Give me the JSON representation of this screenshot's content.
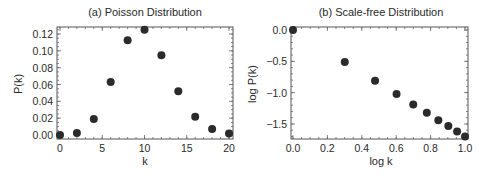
{
  "chart_data": [
    {
      "type": "scatter",
      "title": "(a) Poisson Distribution",
      "xlabel": "k",
      "ylabel": "P(k)",
      "xlim": [
        0,
        20
      ],
      "ylim": [
        0,
        0.128
      ],
      "x_ticks": [
        "0",
        "5",
        "10",
        "15",
        "20"
      ],
      "y_ticks": [
        "0.00",
        "0.02",
        "0.04",
        "0.06",
        "0.08",
        "0.10",
        "0.12"
      ],
      "grid": false,
      "x": [
        0,
        2,
        4,
        6,
        8,
        10,
        12,
        14,
        16,
        18,
        20
      ],
      "values": [
        0.0,
        0.0023,
        0.0189,
        0.0631,
        0.1126,
        0.1251,
        0.0948,
        0.0521,
        0.0217,
        0.0071,
        0.0019
      ]
    },
    {
      "type": "scatter",
      "title": "(b) Scale-free Distribution",
      "xlabel": "log k",
      "ylabel": "log P(k)",
      "xlim": [
        0,
        1.0
      ],
      "ylim": [
        -1.75,
        0.05
      ],
      "x_ticks": [
        "0.0",
        "0.2",
        "0.4",
        "0.6",
        "0.8",
        "1.0"
      ],
      "y_ticks": [
        "0.0",
        "−0.5",
        "−1.0",
        "−1.5"
      ],
      "grid": false,
      "x": [
        0.0,
        0.301,
        0.477,
        0.602,
        0.699,
        0.778,
        0.845,
        0.903,
        0.954,
        1.0
      ],
      "values": [
        0.0,
        -0.51,
        -0.81,
        -1.02,
        -1.19,
        -1.32,
        -1.44,
        -1.53,
        -1.62,
        -1.7
      ]
    }
  ]
}
